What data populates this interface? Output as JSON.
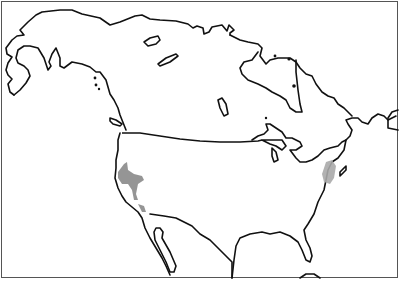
{
  "map": {
    "title": "",
    "region": "North America",
    "style": "black outline map on white with grey shaded areas",
    "frame_color": "#555555",
    "outline_color": "#111111",
    "background_color": "#ffffff",
    "shaded_regions": [
      {
        "name": "west-coast-shaded-region",
        "location": "California / Sierra Nevada",
        "color": "#8a8a8a"
      },
      {
        "name": "east-coast-shaded-region",
        "location": "Northeastern United States (Appalachian / Pennsylvania area)",
        "color": "#aaaaaa"
      }
    ],
    "labels": []
  }
}
